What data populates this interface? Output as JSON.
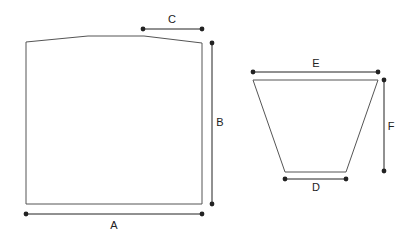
{
  "diagram": {
    "title": "",
    "colors": {
      "shape_stroke": "#555555",
      "dim_line": "#222222",
      "text": "#222222"
    },
    "shapes": [
      {
        "name": "panel",
        "type": "polygon",
        "points": "26,42 88,36 144,36 202,43 202,204 26,204"
      },
      {
        "name": "trapezoid",
        "type": "polygon",
        "points": "253,80 378,80 346,172 285,172"
      }
    ],
    "dimensions": [
      {
        "label": "A",
        "x1": 26,
        "y1": 214,
        "x2": 202,
        "y2": 214,
        "lx": 114,
        "ly": 229
      },
      {
        "label": "B",
        "x1": 212,
        "y1": 43,
        "x2": 212,
        "y2": 204,
        "lx": 220,
        "ly": 126
      },
      {
        "label": "C",
        "x1": 143,
        "y1": 29,
        "x2": 202,
        "y2": 29,
        "lx": 172,
        "ly": 23
      },
      {
        "label": "D",
        "x1": 285,
        "y1": 179,
        "x2": 346,
        "y2": 179,
        "lx": 316,
        "ly": 191
      },
      {
        "label": "E",
        "x1": 253,
        "y1": 72,
        "x2": 378,
        "y2": 72,
        "lx": 316,
        "ly": 67
      },
      {
        "label": "F",
        "x1": 384,
        "y1": 80,
        "x2": 384,
        "y2": 171,
        "lx": 391,
        "ly": 130
      }
    ]
  }
}
